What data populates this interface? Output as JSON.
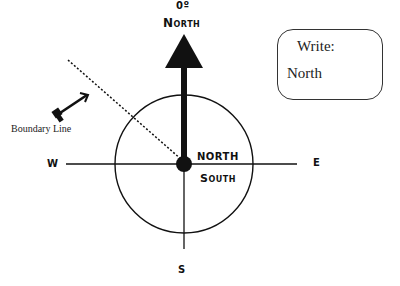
{
  "diagram": {
    "title_degree": "0º",
    "title_direction": "North",
    "cardinal": {
      "west": "W",
      "east": "E",
      "south": "S"
    },
    "center_labels": {
      "upper": "NORTH",
      "lower": "South"
    },
    "boundary_label": "Boundary Line",
    "write_box": {
      "prompt": "Write:",
      "answer": "North"
    },
    "colors": {
      "ink": "#111111",
      "background": "#ffffff"
    }
  }
}
